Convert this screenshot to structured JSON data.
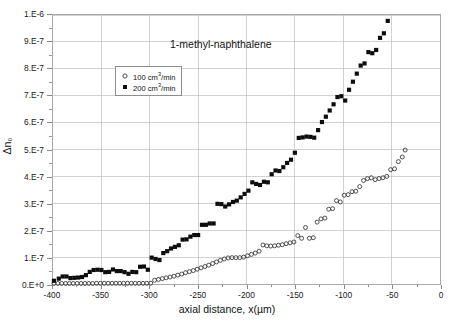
{
  "chart_data": {
    "type": "scatter",
    "title": "1-methyl-naphthalene",
    "xlabel": "axial distance, x(µm)",
    "ylabel": "Δn₀",
    "xlim": [
      -400,
      0
    ],
    "ylim": [
      0,
      1e-06
    ],
    "grid": true,
    "legend_position": "upper-left-inside",
    "xticks": [
      "-400",
      "-350",
      "-300",
      "-250",
      "-200",
      "-150",
      "-100",
      "-50",
      "0"
    ],
    "xtick_values": [
      -400,
      -350,
      -300,
      -250,
      -200,
      -150,
      -100,
      -50,
      0
    ],
    "yticks": [
      "0.E+0",
      "1.E-7",
      "2.E-7",
      "3.E-7",
      "4.E-7",
      "5.E-7",
      "6.E-7",
      "7.E-7",
      "8.E-7",
      "9.E-7",
      "1.E-6"
    ],
    "ytick_values": [
      0,
      1e-07,
      2e-07,
      3e-07,
      4e-07,
      5e-07,
      6e-07,
      7e-07,
      8e-07,
      9e-07,
      1e-06
    ],
    "series": [
      {
        "name": "100 cm3/min",
        "label_main": "100 cm",
        "label_sup": "3",
        "label_tail": "/min",
        "marker": "open-circle",
        "color": "#3a3a3a",
        "points": [
          [
            -399,
            2e-09
          ],
          [
            -395,
            2e-09
          ],
          [
            -391,
            2e-09
          ],
          [
            -387,
            2e-09
          ],
          [
            -383,
            2e-09
          ],
          [
            -379,
            2e-09
          ],
          [
            -375,
            2e-09
          ],
          [
            -371,
            2e-09
          ],
          [
            -367,
            2e-09
          ],
          [
            -363,
            2e-09
          ],
          [
            -359,
            2e-09
          ],
          [
            -355,
            2.5e-09
          ],
          [
            -351,
            2.5e-09
          ],
          [
            -347,
            2.5e-09
          ],
          [
            -343,
            2.5e-09
          ],
          [
            -339,
            2.5e-09
          ],
          [
            -335,
            2.5e-09
          ],
          [
            -331,
            2.5e-09
          ],
          [
            -327,
            2.5e-09
          ],
          [
            -323,
            2.5e-09
          ],
          [
            -319,
            2.5e-09
          ],
          [
            -315,
            2.5e-09
          ],
          [
            -311,
            2.5e-09
          ],
          [
            -307,
            2.5e-09
          ],
          [
            -303,
            2.5e-09
          ],
          [
            -299,
            3e-09
          ],
          [
            -295,
            1.4e-08
          ],
          [
            -291,
            1.7e-08
          ],
          [
            -287,
            2e-08
          ],
          [
            -283,
            2.3e-08
          ],
          [
            -279,
            2.6e-08
          ],
          [
            -275,
            2.9e-08
          ],
          [
            -271,
            3.3e-08
          ],
          [
            -267,
            3.7e-08
          ],
          [
            -263,
            4.2e-08
          ],
          [
            -259,
            4.6e-08
          ],
          [
            -255,
            5e-08
          ],
          [
            -251,
            5.5e-08
          ],
          [
            -247,
            6e-08
          ],
          [
            -243,
            6.5e-08
          ],
          [
            -239,
            7e-08
          ],
          [
            -235,
            7.6e-08
          ],
          [
            -231,
            8.2e-08
          ],
          [
            -227,
            8.8e-08
          ],
          [
            -223,
            9.3e-08
          ],
          [
            -219,
            9.7e-08
          ],
          [
            -215,
            9.8e-08
          ],
          [
            -211,
            9.8e-08
          ],
          [
            -207,
            9.8e-08
          ],
          [
            -203,
            1e-07
          ],
          [
            -199,
            1.05e-07
          ],
          [
            -195,
            1.1e-07
          ],
          [
            -191,
            1.15e-07
          ],
          [
            -187,
            1.22e-07
          ],
          [
            -183,
            1.45e-07
          ],
          [
            -179,
            1.42e-07
          ],
          [
            -175,
            1.41e-07
          ],
          [
            -171,
            1.42e-07
          ],
          [
            -167,
            1.44e-07
          ],
          [
            -163,
            1.46e-07
          ],
          [
            -159,
            1.5e-07
          ],
          [
            -155,
            1.53e-07
          ],
          [
            -151,
            1.56e-07
          ],
          [
            -147,
            1.8e-07
          ],
          [
            -143,
            1.7e-07
          ],
          [
            -139,
            2.1e-07
          ],
          [
            -135,
            1.7e-07
          ],
          [
            -131,
            1.72e-07
          ],
          [
            -127,
            2.3e-07
          ],
          [
            -123,
            2.42e-07
          ],
          [
            -119,
            2.45e-07
          ],
          [
            -115,
            2.78e-07
          ],
          [
            -111,
            2.8e-07
          ],
          [
            -107,
            3.1e-07
          ],
          [
            -103,
            3.05e-07
          ],
          [
            -99,
            3.3e-07
          ],
          [
            -95,
            3.32e-07
          ],
          [
            -91,
            3.43e-07
          ],
          [
            -87,
            3.45e-07
          ],
          [
            -83,
            3.62e-07
          ],
          [
            -79,
            3.85e-07
          ],
          [
            -75,
            3.92e-07
          ],
          [
            -71,
            3.95e-07
          ],
          [
            -67,
            3.88e-07
          ],
          [
            -63,
            3.92e-07
          ],
          [
            -59,
            3.95e-07
          ],
          [
            -55,
            4e-07
          ],
          [
            -51,
            4.25e-07
          ],
          [
            -47,
            4.28e-07
          ],
          [
            -43,
            4.55e-07
          ],
          [
            -39,
            4.72e-07
          ],
          [
            -36,
            4.98e-07
          ]
        ]
      },
      {
        "name": "200 cm3/min",
        "label_main": "200 cm",
        "label_sup": "3",
        "label_tail": "/min",
        "marker": "filled-square",
        "color": "#0d0d0d",
        "points": [
          [
            -399,
            1.2e-08
          ],
          [
            -394,
            2e-08
          ],
          [
            -390,
            2.8e-08
          ],
          [
            -386,
            2.8e-08
          ],
          [
            -382,
            2.2e-08
          ],
          [
            -378,
            2.3e-08
          ],
          [
            -374,
            2.4e-08
          ],
          [
            -370,
            2.6e-08
          ],
          [
            -366,
            3.3e-08
          ],
          [
            -362,
            4.5e-08
          ],
          [
            -358,
            5.2e-08
          ],
          [
            -354,
            5.3e-08
          ],
          [
            -350,
            5.2e-08
          ],
          [
            -346,
            4.4e-08
          ],
          [
            -342,
            4.5e-08
          ],
          [
            -338,
            5.4e-08
          ],
          [
            -334,
            4.8e-08
          ],
          [
            -330,
            4.8e-08
          ],
          [
            -326,
            4.4e-08
          ],
          [
            -322,
            3.8e-08
          ],
          [
            -318,
            4.5e-08
          ],
          [
            -314,
            4.4e-08
          ],
          [
            -310,
            6.4e-08
          ],
          [
            -306,
            6.5e-08
          ],
          [
            -302,
            5.3e-08
          ],
          [
            -298,
            9.8e-08
          ],
          [
            -294,
            9.3e-08
          ],
          [
            -290,
            8.9e-08
          ],
          [
            -286,
            1.15e-07
          ],
          [
            -282,
            1.22e-07
          ],
          [
            -278,
            1.32e-07
          ],
          [
            -274,
            1.38e-07
          ],
          [
            -270,
            1.44e-07
          ],
          [
            -266,
            1.65e-07
          ],
          [
            -262,
            1.66e-07
          ],
          [
            -258,
            1.76e-07
          ],
          [
            -254,
            1.82e-07
          ],
          [
            -250,
            1.82e-07
          ],
          [
            -246,
            2.2e-07
          ],
          [
            -242,
            2.2e-07
          ],
          [
            -238,
            2.25e-07
          ],
          [
            -234,
            2.25e-07
          ],
          [
            -230,
            2.98e-07
          ],
          [
            -226,
            2.97e-07
          ],
          [
            -222,
            2.88e-07
          ],
          [
            -218,
            2.96e-07
          ],
          [
            -214,
            3.05e-07
          ],
          [
            -210,
            3.1e-07
          ],
          [
            -206,
            3.22e-07
          ],
          [
            -202,
            3.35e-07
          ],
          [
            -198,
            3.47e-07
          ],
          [
            -194,
            3.78e-07
          ],
          [
            -190,
            3.72e-07
          ],
          [
            -186,
            3.68e-07
          ],
          [
            -182,
            3.8e-07
          ],
          [
            -178,
            3.78e-07
          ],
          [
            -174,
            4.08e-07
          ],
          [
            -170,
            4.22e-07
          ],
          [
            -166,
            4.2e-07
          ],
          [
            -162,
            4.34e-07
          ],
          [
            -158,
            4.5e-07
          ],
          [
            -154,
            4.62e-07
          ],
          [
            -150,
            4.88e-07
          ],
          [
            -146,
            5.43e-07
          ],
          [
            -142,
            5.45e-07
          ],
          [
            -138,
            5.48e-07
          ],
          [
            -134,
            5.47e-07
          ],
          [
            -130,
            5.44e-07
          ],
          [
            -126,
            5.72e-07
          ],
          [
            -122,
            6.02e-07
          ],
          [
            -118,
            6.22e-07
          ],
          [
            -114,
            6.45e-07
          ],
          [
            -110,
            6.68e-07
          ],
          [
            -106,
            6.95e-07
          ],
          [
            -102,
            6.98e-07
          ],
          [
            -98,
            6.82e-07
          ],
          [
            -94,
            7.22e-07
          ],
          [
            -90,
            7.52e-07
          ],
          [
            -86,
            7.82e-07
          ],
          [
            -82,
            8.12e-07
          ],
          [
            -78,
            8.2e-07
          ],
          [
            -74,
            8.62e-07
          ],
          [
            -70,
            8.58e-07
          ],
          [
            -66,
            8.7e-07
          ],
          [
            -62,
            9.15e-07
          ],
          [
            -58,
            9.32e-07
          ],
          [
            -54,
            9.78e-07
          ]
        ]
      }
    ]
  }
}
